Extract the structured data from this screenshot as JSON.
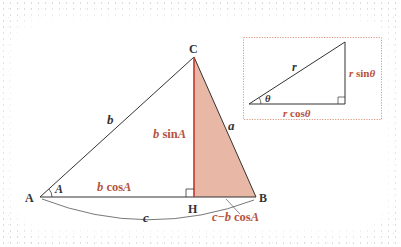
{
  "diagram": {
    "main_triangle": {
      "vertices": {
        "A": "A",
        "B": "B",
        "C": "C",
        "H": "H"
      },
      "side_labels": {
        "b": "b",
        "a": "a",
        "c": "c"
      },
      "angle_label": "A",
      "height_label": "b sinA",
      "base_left_label": "b cosA",
      "base_right_label": "c−b cosA"
    },
    "inset_triangle": {
      "hypotenuse_label": "r",
      "angle_label": "θ",
      "opposite_label": "r sinθ",
      "adjacent_label": "r cosθ"
    },
    "colors": {
      "line": "#333333",
      "accent_red": "#c0392b",
      "label_red": "#b5533e",
      "fill": "#e8b7a6",
      "inset_border": "#d88a6f"
    }
  }
}
